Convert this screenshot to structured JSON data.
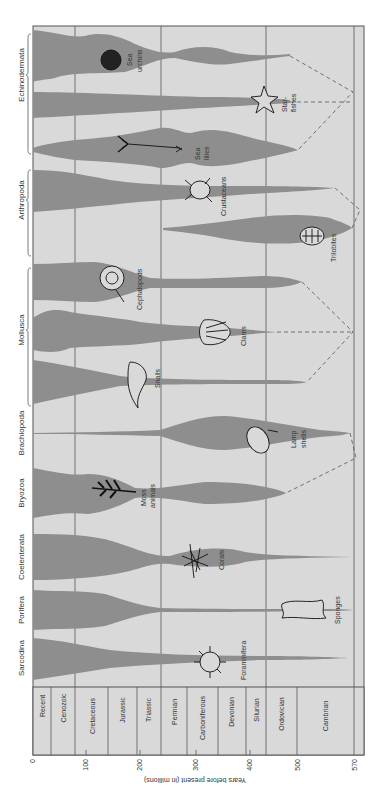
{
  "title": "",
  "axis": {
    "title": "Years before present (in millions)",
    "ticks": [
      {
        "label": "0",
        "value": 0
      },
      {
        "label": "100",
        "value": 100
      },
      {
        "label": "200",
        "value": 200
      },
      {
        "label": "300",
        "value": 300
      },
      {
        "label": "400",
        "value": 400
      },
      {
        "label": "500",
        "value": 500
      },
      {
        "label": "570",
        "value": 570
      }
    ]
  },
  "periods": [
    {
      "name": "Recent",
      "start": 0,
      "end": 34
    },
    {
      "name": "Cenozoic",
      "start": 34,
      "end": 80
    },
    {
      "name": "Cretaceous",
      "start": 80,
      "end": 142
    },
    {
      "name": "Jurassic",
      "start": 142,
      "end": 196
    },
    {
      "name": "Triassic",
      "start": 196,
      "end": 240
    },
    {
      "name": "Permian",
      "start": 240,
      "end": 290
    },
    {
      "name": "Carboniferous",
      "start": 290,
      "end": 348
    },
    {
      "name": "Devonian",
      "start": 348,
      "end": 400
    },
    {
      "name": "Silurian",
      "start": 400,
      "end": 438
    },
    {
      "name": "Ordovician",
      "start": 438,
      "end": 496
    },
    {
      "name": "Cambrian",
      "start": 496,
      "end": 570
    }
  ],
  "phyla": [
    {
      "name": "Echinodermata",
      "groups": [
        "Sea urchins",
        "Star-fishes",
        "Sea lilies"
      ]
    },
    {
      "name": "Arthropoda",
      "groups": [
        "Crustaceans",
        "Trilobites"
      ]
    },
    {
      "name": "Mollusca",
      "groups": [
        "Cephalopods",
        "Clams",
        "Snails"
      ]
    },
    {
      "name": "Brachiopoda",
      "groups": [
        "Lamp shells"
      ]
    },
    {
      "name": "Bryozoa",
      "groups": [
        "Moss animals"
      ]
    },
    {
      "name": "Coelenterata",
      "groups": [
        "Corals"
      ]
    },
    {
      "name": "Porifera",
      "groups": [
        "Sponges"
      ]
    },
    {
      "name": "Sarcodina",
      "groups": [
        "Foraminifera"
      ]
    }
  ],
  "lineages": [
    {
      "label_lines": [
        "Sea",
        "urchins"
      ],
      "phylum": "Echinodermata",
      "origin_my": 490,
      "icon": "sea-urchin-icon"
    },
    {
      "label_lines": [
        "Star-",
        "fishes"
      ],
      "phylum": "Echinodermata",
      "origin_my": 490,
      "icon": "starfish-icon"
    },
    {
      "label_lines": [
        "Sea",
        "lilies"
      ],
      "phylum": "Echinodermata",
      "origin_my": 500,
      "icon": "sea-lily-icon"
    },
    {
      "label_lines": [
        "Crustaceans"
      ],
      "phylum": "Arthropoda",
      "origin_my": 560,
      "icon": "crab-icon"
    },
    {
      "label_lines": [
        "Trilobites"
      ],
      "phylum": "Arthropoda",
      "origin_my": 570,
      "extinct_my": 240,
      "icon": "trilobite-icon"
    },
    {
      "label_lines": [
        "Cephalopods"
      ],
      "phylum": "Mollusca",
      "origin_my": 505,
      "icon": "ammonite-icon"
    },
    {
      "label_lines": [
        "Clams"
      ],
      "phylum": "Mollusca",
      "origin_my": 460,
      "icon": "clam-shell-icon"
    },
    {
      "label_lines": [
        "Snails"
      ],
      "phylum": "Mollusca",
      "origin_my": 515,
      "icon": "snail-shell-icon"
    },
    {
      "label_lines": [
        "Lamp",
        "shells"
      ],
      "phylum": "Brachiopoda",
      "origin_my": 565,
      "icon": "lamp-shell-icon"
    },
    {
      "label_lines": [
        "Moss",
        "animals"
      ],
      "phylum": "Bryozoa",
      "origin_my": 480,
      "icon": "bryozoan-branch-icon"
    },
    {
      "label_lines": [
        "Corals"
      ],
      "phylum": "Coelenterata",
      "origin_my": 570,
      "icon": "coral-icon"
    },
    {
      "label_lines": [
        "Sponges"
      ],
      "phylum": "Porifera",
      "origin_my": 570,
      "icon": "sponge-icon"
    },
    {
      "label_lines": [
        "Foraminifera"
      ],
      "phylum": "Sarcodina",
      "origin_my": 560,
      "icon": "foraminifera-icon"
    }
  ],
  "colors": {
    "spindle": "#8e8e8e",
    "panel": "#d9d9d9",
    "grid": "#555555",
    "text": "#333333"
  }
}
